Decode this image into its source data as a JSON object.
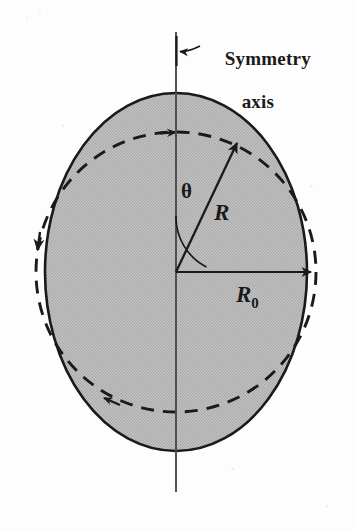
{
  "figure": {
    "kind": "deformed-nucleus-diagram",
    "background_color": "#fdfdfd",
    "ink_color": "#1a1a1a",
    "fill_color": "#b9b9b9",
    "labels": {
      "symmetry_axis_line1": "Symmetry",
      "symmetry_axis_line2": "axis",
      "theta": "θ",
      "radius_r": "R",
      "radius_r0_base": "R",
      "radius_r0_sub": "0"
    },
    "geometry": {
      "center_x": 176,
      "center_y": 272,
      "ellipse_semi_axis_horizontal": 131,
      "ellipse_semi_axis_vertical": 179,
      "sphere_dashed_radius": 140,
      "axis_top_y": 32,
      "axis_bottom_y": 492,
      "theta_arc_radius": 56,
      "theta_degrees": 33,
      "r_vector_angle_from_axis_degrees": 33,
      "r0_arrow_angle_degrees": 0
    },
    "elements": [
      "vertical symmetry axis line",
      "gray filled prolate ellipse (deformed nucleus)",
      "dashed circle of radius R0 (undeformed sphere)",
      "radius vector R with arrowhead at ellipse surface",
      "angle arc theta between axis and R",
      "horizontal radius R0 with arrowhead",
      "curved leader arrow to symmetry axis"
    ]
  }
}
